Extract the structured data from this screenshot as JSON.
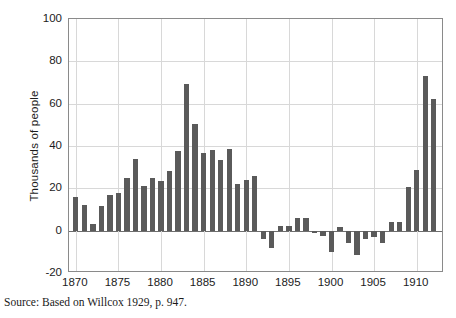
{
  "figure": {
    "source_note": "Source: Based on Willcox 1929, p. 947."
  },
  "chart_data": {
    "type": "bar",
    "title": "",
    "subtitle": "",
    "xlabel": "",
    "ylabel": "Thousands of people",
    "ylim": [
      -20,
      100
    ],
    "xlim": [
      1869.2,
      1913.2
    ],
    "ytick_labels": [
      "100",
      "80",
      "60",
      "40",
      "20",
      "0",
      "-20"
    ],
    "yticks": [
      100,
      80,
      60,
      40,
      20,
      0,
      -20
    ],
    "xtick_labels": [
      "1870",
      "1875",
      "1880",
      "1885",
      "1890",
      "1895",
      "1900",
      "1905",
      "1910"
    ],
    "xticks": [
      1870,
      1875,
      1880,
      1885,
      1890,
      1895,
      1900,
      1905,
      1910
    ],
    "grid": "both-light",
    "legend": "none",
    "bar_color": "#5a5a5a",
    "categories": [
      1870,
      1871,
      1872,
      1873,
      1874,
      1875,
      1876,
      1877,
      1878,
      1879,
      1880,
      1881,
      1882,
      1883,
      1884,
      1885,
      1886,
      1887,
      1888,
      1889,
      1890,
      1891,
      1892,
      1893,
      1894,
      1895,
      1896,
      1897,
      1898,
      1899,
      1900,
      1901,
      1902,
      1903,
      1904,
      1905,
      1906,
      1907,
      1908,
      1909,
      1910,
      1911,
      1912
    ],
    "values": [
      16,
      12,
      3,
      11.5,
      17,
      18,
      25,
      34,
      21,
      25,
      23.5,
      28,
      37.5,
      69.5,
      50.5,
      36.5,
      38,
      33.5,
      38.5,
      22,
      24,
      26,
      -4,
      -8,
      2,
      2,
      6,
      6,
      -1,
      -2.5,
      -10,
      1.5,
      -6,
      -11.5,
      -4,
      -3,
      -6,
      4,
      4,
      20.5,
      28.5,
      73,
      62
    ]
  }
}
